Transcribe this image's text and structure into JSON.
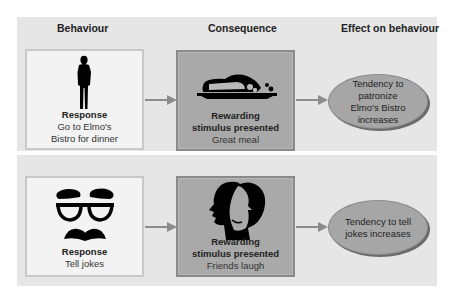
{
  "headers": {
    "behaviour": "Behaviour",
    "consequence": "Consequence",
    "effect": "Effect on behaviour"
  },
  "rows": [
    {
      "behaviour": {
        "icon": "standing-man-icon",
        "title": "Response",
        "desc_line1": "Go to Elmo's",
        "desc_line2": "Bistro for dinner"
      },
      "consequence": {
        "icon": "meal-platter-icon",
        "title_line1": "Rewarding",
        "title_line2": "stimulus presented",
        "desc": "Great meal"
      },
      "effect": {
        "line1": "Tendency to patronize",
        "line2": "Elmo's Bistro increases"
      }
    },
    {
      "behaviour": {
        "icon": "groucho-glasses-icon",
        "title": "Response",
        "desc_line1": "Tell jokes"
      },
      "consequence": {
        "icon": "laughing-faces-icon",
        "title_line1": "Rewarding",
        "title_line2": "stimulus presented",
        "desc": "Friends laugh"
      },
      "effect": {
        "line1": "Tendency to tell",
        "line2": "jokes increases"
      }
    }
  ],
  "colors": {
    "panel": "#e6e6e6",
    "behaviour_box": "#f3f3f3",
    "consequence_box": "#a9a9a9",
    "effect_ellipse": "#a6a6a6",
    "arrow": "#8c8c8c"
  }
}
